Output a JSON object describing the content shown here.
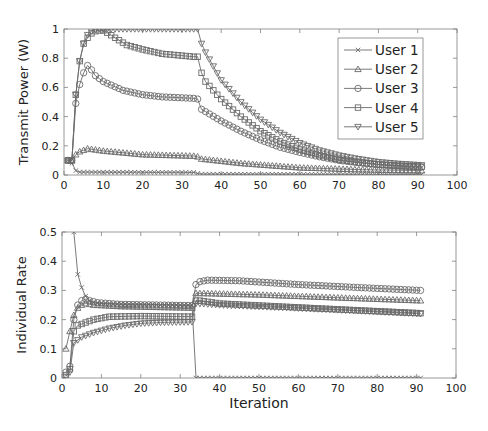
{
  "chart_data": [
    {
      "type": "line",
      "title": "",
      "xlabel": "",
      "ylabel": "Transmit Power (W)",
      "xlim": [
        0,
        100
      ],
      "ylim": [
        0,
        1
      ],
      "xticks": [
        0,
        10,
        20,
        30,
        40,
        50,
        60,
        70,
        80,
        90,
        100
      ],
      "yticks": [
        0,
        0.2,
        0.4,
        0.6,
        0.8,
        1
      ],
      "ytick_labels": [
        "0",
        "0.2",
        "0.4",
        "0.6",
        "0.8",
        "1"
      ],
      "grid": false,
      "legend_position": "upper right",
      "x_range_points": [
        1,
        91
      ],
      "series": [
        {
          "name": "User 1",
          "marker": "x",
          "keypoints": [
            [
              1,
              0.1
            ],
            [
              2,
              0.08
            ],
            [
              3,
              0.03
            ],
            [
              4,
              0.02
            ],
            [
              33,
              0.018
            ],
            [
              34,
              0.01
            ],
            [
              35,
              0.006
            ],
            [
              91,
              0.004
            ]
          ]
        },
        {
          "name": "User 2",
          "marker": "triangle-up",
          "keypoints": [
            [
              1,
              0.1
            ],
            [
              2,
              0.1
            ],
            [
              3,
              0.14
            ],
            [
              4,
              0.16
            ],
            [
              5,
              0.17
            ],
            [
              6,
              0.18
            ],
            [
              10,
              0.165
            ],
            [
              20,
              0.14
            ],
            [
              33,
              0.13
            ],
            [
              34,
              0.125
            ],
            [
              35,
              0.11
            ],
            [
              45,
              0.08
            ],
            [
              60,
              0.05
            ],
            [
              75,
              0.037
            ],
            [
              91,
              0.03
            ]
          ]
        },
        {
          "name": "User 3",
          "marker": "circle",
          "keypoints": [
            [
              1,
              0.1
            ],
            [
              2,
              0.1
            ],
            [
              3,
              0.49
            ],
            [
              4,
              0.62
            ],
            [
              5,
              0.7
            ],
            [
              6,
              0.75
            ],
            [
              7,
              0.72
            ],
            [
              8,
              0.68
            ],
            [
              10,
              0.64
            ],
            [
              15,
              0.58
            ],
            [
              20,
              0.55
            ],
            [
              25,
              0.535
            ],
            [
              33,
              0.525
            ],
            [
              34,
              0.52
            ],
            [
              35,
              0.45
            ],
            [
              40,
              0.37
            ],
            [
              45,
              0.3
            ],
            [
              50,
              0.24
            ],
            [
              55,
              0.19
            ],
            [
              60,
              0.155
            ],
            [
              65,
              0.125
            ],
            [
              70,
              0.1
            ],
            [
              75,
              0.085
            ],
            [
              80,
              0.072
            ],
            [
              85,
              0.062
            ],
            [
              91,
              0.055
            ]
          ]
        },
        {
          "name": "User 4",
          "marker": "square",
          "keypoints": [
            [
              1,
              0.1
            ],
            [
              2,
              0.1
            ],
            [
              3,
              0.55
            ],
            [
              4,
              0.78
            ],
            [
              5,
              0.9
            ],
            [
              6,
              0.94
            ],
            [
              7,
              0.97
            ],
            [
              8,
              0.985
            ],
            [
              9,
              0.99
            ],
            [
              10,
              0.99
            ],
            [
              11,
              0.975
            ],
            [
              13,
              0.94
            ],
            [
              16,
              0.89
            ],
            [
              20,
              0.86
            ],
            [
              25,
              0.83
            ],
            [
              33,
              0.81
            ],
            [
              34,
              0.81
            ],
            [
              35,
              0.7
            ],
            [
              36,
              0.64
            ],
            [
              40,
              0.52
            ],
            [
              45,
              0.4
            ],
            [
              50,
              0.3
            ],
            [
              55,
              0.23
            ],
            [
              60,
              0.175
            ],
            [
              65,
              0.135
            ],
            [
              70,
              0.105
            ],
            [
              75,
              0.085
            ],
            [
              80,
              0.072
            ],
            [
              85,
              0.063
            ],
            [
              91,
              0.056
            ]
          ]
        },
        {
          "name": "User 5",
          "marker": "triangle-down",
          "keypoints": [
            [
              1,
              0.1
            ],
            [
              2,
              0.1
            ],
            [
              3,
              0.55
            ],
            [
              4,
              0.78
            ],
            [
              5,
              0.9
            ],
            [
              6,
              0.96
            ],
            [
              7,
              0.985
            ],
            [
              8,
              0.995
            ],
            [
              9,
              1.0
            ],
            [
              33,
              1.0
            ],
            [
              34,
              1.0
            ],
            [
              35,
              0.9
            ],
            [
              36,
              0.84
            ],
            [
              40,
              0.65
            ],
            [
              45,
              0.5
            ],
            [
              50,
              0.38
            ],
            [
              55,
              0.29
            ],
            [
              60,
              0.22
            ],
            [
              65,
              0.17
            ],
            [
              70,
              0.135
            ],
            [
              75,
              0.11
            ],
            [
              80,
              0.09
            ],
            [
              85,
              0.078
            ],
            [
              91,
              0.068
            ]
          ]
        }
      ]
    },
    {
      "type": "line",
      "title": "",
      "xlabel": "Iteration",
      "ylabel": "Individual Rate",
      "xlim": [
        0,
        100
      ],
      "ylim": [
        0,
        0.5
      ],
      "xticks": [
        0,
        10,
        20,
        30,
        40,
        50,
        60,
        70,
        80,
        90,
        100
      ],
      "yticks": [
        0,
        0.1,
        0.2,
        0.3,
        0.4,
        0.5
      ],
      "ytick_labels": [
        "0",
        "0.1",
        "0.2",
        "0.3",
        "0.4",
        "0.5"
      ],
      "grid": false,
      "x_range_points": [
        1,
        91
      ],
      "series": [
        {
          "name": "User 1",
          "marker": "x",
          "keypoints": [
            [
              1,
              1.2
            ],
            [
              3,
              0.5
            ],
            [
              4,
              0.355
            ],
            [
              5,
              0.31
            ],
            [
              6,
              0.28
            ],
            [
              7,
              0.265
            ],
            [
              8,
              0.258
            ],
            [
              10,
              0.255
            ],
            [
              33,
              0.25
            ],
            [
              34,
              0.0
            ],
            [
              91,
              0.0
            ]
          ]
        },
        {
          "name": "User 2",
          "marker": "triangle-up",
          "keypoints": [
            [
              1,
              0.1
            ],
            [
              2,
              0.16
            ],
            [
              3,
              0.215
            ],
            [
              4,
              0.24
            ],
            [
              5,
              0.25
            ],
            [
              6,
              0.255
            ],
            [
              8,
              0.25
            ],
            [
              15,
              0.245
            ],
            [
              33,
              0.24
            ],
            [
              34,
              0.29
            ],
            [
              35,
              0.29
            ],
            [
              50,
              0.285
            ],
            [
              70,
              0.275
            ],
            [
              91,
              0.265
            ]
          ]
        },
        {
          "name": "User 3",
          "marker": "circle",
          "keypoints": [
            [
              1,
              0.02
            ],
            [
              2,
              0.04
            ],
            [
              3,
              0.2
            ],
            [
              4,
              0.25
            ],
            [
              5,
              0.265
            ],
            [
              6,
              0.27
            ],
            [
              7,
              0.265
            ],
            [
              9,
              0.258
            ],
            [
              15,
              0.252
            ],
            [
              33,
              0.248
            ],
            [
              34,
              0.32
            ],
            [
              35,
              0.33
            ],
            [
              37,
              0.335
            ],
            [
              45,
              0.333
            ],
            [
              60,
              0.32
            ],
            [
              75,
              0.31
            ],
            [
              91,
              0.3
            ]
          ]
        },
        {
          "name": "User 4",
          "marker": "square",
          "keypoints": [
            [
              1,
              0.01
            ],
            [
              2,
              0.03
            ],
            [
              3,
              0.16
            ],
            [
              4,
              0.18
            ],
            [
              5,
              0.185
            ],
            [
              6,
              0.19
            ],
            [
              8,
              0.2
            ],
            [
              12,
              0.21
            ],
            [
              20,
              0.212
            ],
            [
              33,
              0.21
            ],
            [
              34,
              0.265
            ],
            [
              35,
              0.265
            ],
            [
              40,
              0.255
            ],
            [
              55,
              0.245
            ],
            [
              75,
              0.232
            ],
            [
              91,
              0.222
            ]
          ]
        },
        {
          "name": "User 5",
          "marker": "triangle-down",
          "keypoints": [
            [
              1,
              0.005
            ],
            [
              2,
              0.02
            ],
            [
              3,
              0.12
            ],
            [
              4,
              0.13
            ],
            [
              5,
              0.14
            ],
            [
              6,
              0.145
            ],
            [
              8,
              0.155
            ],
            [
              12,
              0.17
            ],
            [
              16,
              0.18
            ],
            [
              20,
              0.187
            ],
            [
              25,
              0.19
            ],
            [
              33,
              0.192
            ],
            [
              34,
              0.255
            ],
            [
              35,
              0.255
            ],
            [
              40,
              0.25
            ],
            [
              55,
              0.242
            ],
            [
              75,
              0.23
            ],
            [
              91,
              0.22
            ]
          ]
        }
      ]
    }
  ],
  "legend": {
    "entries": [
      {
        "label": "User 1",
        "marker": "x"
      },
      {
        "label": "User 2",
        "marker": "triangle-up"
      },
      {
        "label": "User 3",
        "marker": "circle"
      },
      {
        "label": "User 4",
        "marker": "square"
      },
      {
        "label": "User 5",
        "marker": "triangle-down"
      }
    ]
  },
  "colors": {
    "line": "#6b6b6b",
    "marker": "#6b6b6b",
    "axis": "#808080",
    "text": "#222222"
  }
}
